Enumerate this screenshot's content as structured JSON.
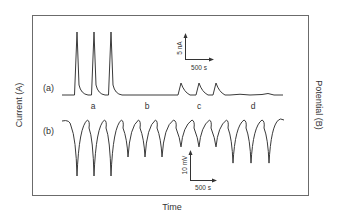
{
  "chart_data": {
    "type": "line",
    "title": "",
    "xlabel": "Time",
    "ylabel_left": "Current (A)",
    "ylabel_right": "Potential (B)",
    "grid": false,
    "legend": "none",
    "segment_labels": [
      "a",
      "b",
      "c",
      "d"
    ],
    "series": [
      {
        "name": "(a)",
        "quantity": "Current",
        "scale_bar": {
          "y": "5 nA",
          "x": "500 s"
        },
        "description": "Three tall current peaks in segment a; no response in b; three small peaks in c; no response in d",
        "peaks": [
          {
            "segment": "a",
            "relative_height": 1.0
          },
          {
            "segment": "a",
            "relative_height": 1.0
          },
          {
            "segment": "a",
            "relative_height": 1.0
          },
          {
            "segment": "c",
            "relative_height": 0.19
          },
          {
            "segment": "c",
            "relative_height": 0.19
          },
          {
            "segment": "c",
            "relative_height": 0.19
          }
        ]
      },
      {
        "name": "(b)",
        "quantity": "Potential",
        "scale_bar": {
          "y": "10 mV",
          "x": "500 s"
        },
        "description": "Twelve downward potential dips, three in each segment a-d",
        "dips": [
          {
            "segment": "a",
            "relative_depth": 1.0
          },
          {
            "segment": "a",
            "relative_depth": 1.0
          },
          {
            "segment": "a",
            "relative_depth": 1.0
          },
          {
            "segment": "b",
            "relative_depth": 0.66
          },
          {
            "segment": "b",
            "relative_depth": 0.66
          },
          {
            "segment": "b",
            "relative_depth": 0.66
          },
          {
            "segment": "c",
            "relative_depth": 0.48
          },
          {
            "segment": "c",
            "relative_depth": 0.48
          },
          {
            "segment": "c",
            "relative_depth": 0.48
          },
          {
            "segment": "d",
            "relative_depth": 0.77
          },
          {
            "segment": "d",
            "relative_depth": 0.77
          },
          {
            "segment": "d",
            "relative_depth": 0.77
          }
        ]
      }
    ]
  },
  "labels": {
    "trace_a": "(a)",
    "trace_b": "(b)",
    "seg_a": "a",
    "seg_b": "b",
    "seg_c": "c",
    "seg_d": "d",
    "scale_a_y": "5 nA",
    "scale_a_x": "500 s",
    "scale_b_y": "10 mV",
    "scale_b_x": "500 s",
    "xlabel": "Time",
    "ylabel_left": "Current (A)",
    "ylabel_right": "Potential (B)"
  },
  "colors": {
    "frame": "#6b6b6b",
    "trace": "#3a3a3a",
    "text": "#333333"
  }
}
